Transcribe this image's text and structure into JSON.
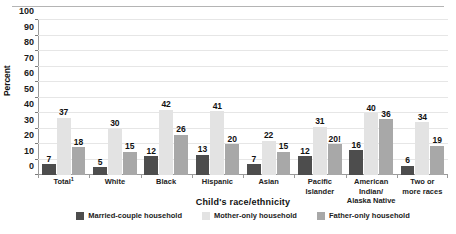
{
  "chart_data": {
    "type": "bar",
    "title": "",
    "xlabel": "Child's race/ethnicity",
    "ylabel": "Percent",
    "ylim": [
      0,
      100
    ],
    "ytick_step": 10,
    "yticks": [
      0,
      10,
      20,
      30,
      40,
      50,
      60,
      70,
      80,
      90,
      100
    ],
    "grid": true,
    "legend_position": "bottom",
    "categories": [
      "Total",
      "White",
      "Black",
      "Hispanic",
      "Asian",
      "Pacific Islander",
      "American Indian/ Alaska Native",
      "Two or more races"
    ],
    "category_lines": [
      [
        "Total"
      ],
      [
        "White"
      ],
      [
        "Black"
      ],
      [
        "Hispanic"
      ],
      [
        "Asian"
      ],
      [
        "Pacific",
        "Islander"
      ],
      [
        "American Indian/",
        "Alaska Native"
      ],
      [
        "Two or",
        "more races"
      ]
    ],
    "category_footnotes": [
      "1",
      "",
      "",
      "",
      "",
      "",
      "",
      ""
    ],
    "series": [
      {
        "name": "Married-couple household",
        "color": "#4d4d4d",
        "values": [
          7,
          5,
          12,
          13,
          7,
          12,
          16,
          6
        ],
        "labels": [
          "7",
          "5",
          "12",
          "13",
          "7",
          "12",
          "16",
          "6"
        ]
      },
      {
        "name": "Mother-only household",
        "color": "#e3e3e3",
        "values": [
          37,
          30,
          42,
          41,
          22,
          31,
          40,
          34
        ],
        "labels": [
          "37",
          "30",
          "42",
          "41",
          "22",
          "31",
          "40",
          "34"
        ]
      },
      {
        "name": "Father-only household",
        "color": "#a8a8a8",
        "values": [
          18,
          15,
          26,
          20,
          15,
          20,
          36,
          19
        ],
        "labels": [
          "18",
          "15",
          "26",
          "20",
          "15",
          "20!",
          "36",
          "19"
        ]
      }
    ]
  },
  "legend": {
    "items": [
      {
        "label": "Married-couple household"
      },
      {
        "label": "Mother-only household"
      },
      {
        "label": "Father-only household"
      }
    ]
  }
}
